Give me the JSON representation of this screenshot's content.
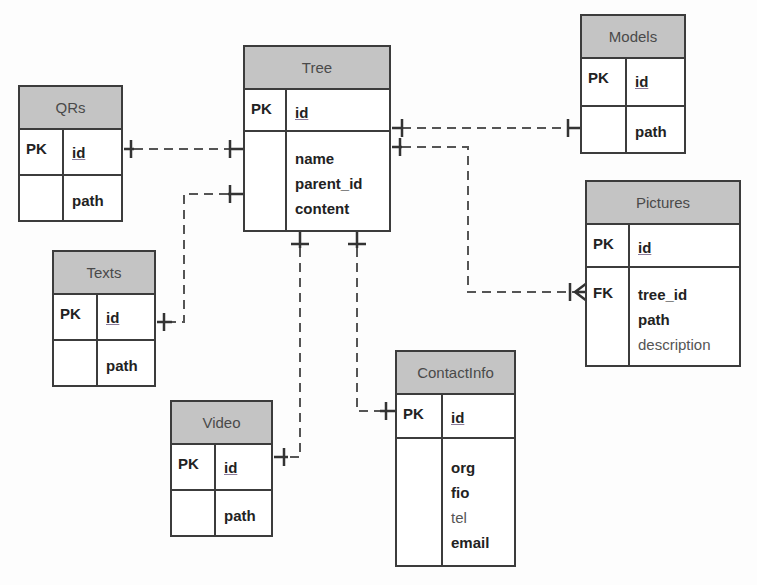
{
  "entities": {
    "tree": {
      "title": "Tree",
      "pk_label": "PK",
      "pk_field": "id",
      "fields": [
        "name",
        "parent_id",
        "content"
      ]
    },
    "models": {
      "title": "Models",
      "pk_label": "PK",
      "pk_field": "id",
      "fields": [
        "path"
      ]
    },
    "qrs": {
      "title": "QRs",
      "pk_label": "PK",
      "pk_field": "id",
      "fields": [
        "path"
      ]
    },
    "texts": {
      "title": "Texts",
      "pk_label": "PK",
      "pk_field": "id",
      "fields": [
        "path"
      ]
    },
    "pictures": {
      "title": "Pictures",
      "pk_label": "PK",
      "pk_field": "id",
      "fk_label": "FK",
      "fields": [
        "tree_id",
        "path",
        "description"
      ]
    },
    "contactinfo": {
      "title": "ContactInfo",
      "pk_label": "PK",
      "pk_field": "id",
      "fields": [
        "org",
        "fio",
        "tel",
        "email"
      ]
    },
    "video": {
      "title": "Video",
      "pk_label": "PK",
      "pk_field": "id",
      "fields": [
        "path"
      ]
    }
  },
  "relationships": [
    {
      "from": "Tree",
      "to": "Models",
      "type": "one-to-one"
    },
    {
      "from": "Tree",
      "to": "QRs",
      "type": "one-to-one"
    },
    {
      "from": "Tree",
      "to": "Texts",
      "type": "one-to-one"
    },
    {
      "from": "Tree",
      "to": "Pictures",
      "type": "one-to-many"
    },
    {
      "from": "Tree",
      "to": "Video",
      "type": "one-to-one"
    },
    {
      "from": "Tree",
      "to": "ContactInfo",
      "type": "one-to-one"
    }
  ],
  "colors": {
    "header_bg": "#c4c4c4",
    "border": "#3c3c3c",
    "line": "#555555",
    "background": "#fdfdfd"
  }
}
